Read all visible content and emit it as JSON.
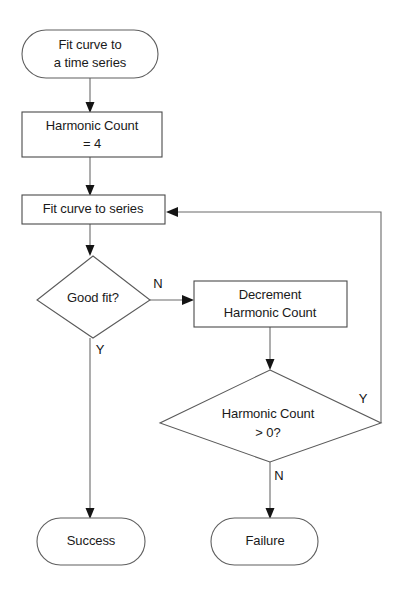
{
  "diagram": {
    "type": "flowchart",
    "background_color": "#ffffff",
    "line_color": "#6a6a6a",
    "text_color": "#141414",
    "nodes": [
      {
        "id": "start",
        "shape": "terminator",
        "lines": [
          "Fit curve to",
          "a time series"
        ],
        "line1": "Fit curve to",
        "line2": "a time series"
      },
      {
        "id": "init_harmonic_count",
        "shape": "process",
        "lines": [
          "Harmonic Count",
          "= 4"
        ],
        "line1": "Harmonic Count",
        "line2": "= 4"
      },
      {
        "id": "fit_curve",
        "shape": "process",
        "lines": [
          "Fit curve to series"
        ],
        "line1": "Fit curve to series",
        "line2": ""
      },
      {
        "id": "good_fit",
        "shape": "decision",
        "lines": [
          "Good fit?"
        ],
        "line1": "Good fit?",
        "line2": ""
      },
      {
        "id": "decrement",
        "shape": "process",
        "lines": [
          "Decrement",
          "Harmonic Count"
        ],
        "line1": "Decrement",
        "line2": "Harmonic Count"
      },
      {
        "id": "count_positive",
        "shape": "decision",
        "lines": [
          "Harmonic Count",
          "> 0?"
        ],
        "line1": "Harmonic Count",
        "line2": "> 0?"
      },
      {
        "id": "success",
        "shape": "terminator",
        "lines": [
          "Success"
        ],
        "line1": "Success",
        "line2": ""
      },
      {
        "id": "failure",
        "shape": "terminator",
        "lines": [
          "Failure"
        ],
        "line1": "Failure",
        "line2": ""
      }
    ],
    "edge_labels": {
      "good_fit_no": "N",
      "good_fit_yes": "Y",
      "count_positive_yes": "Y",
      "count_positive_no": "N"
    },
    "edges": [
      {
        "from": "start",
        "to": "init_harmonic_count",
        "label": ""
      },
      {
        "from": "init_harmonic_count",
        "to": "fit_curve",
        "label": ""
      },
      {
        "from": "fit_curve",
        "to": "good_fit",
        "label": ""
      },
      {
        "from": "good_fit",
        "to": "decrement",
        "label": "N"
      },
      {
        "from": "good_fit",
        "to": "success",
        "label": "Y"
      },
      {
        "from": "decrement",
        "to": "count_positive",
        "label": ""
      },
      {
        "from": "count_positive",
        "to": "fit_curve",
        "label": "Y"
      },
      {
        "from": "count_positive",
        "to": "failure",
        "label": "N"
      }
    ]
  }
}
